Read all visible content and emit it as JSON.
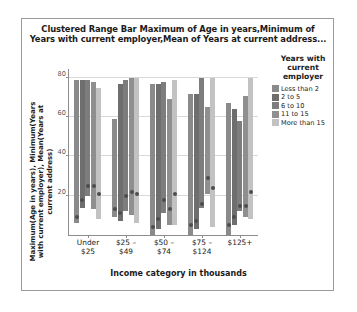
{
  "chart_data": {
    "type": "bar",
    "title": "Clustered Range Bar Maximum of Age in years,Minimum of Years with current employer,Mean of Years at current address...",
    "xlabel": "Income category in thousands",
    "ylabel": "Maximum(Age in years), Minimum(Years with current employer), Mean(Years at current address)",
    "ylim": [
      0,
      85
    ],
    "yticks": [
      20,
      40,
      60,
      80
    ],
    "grid": true,
    "legend_position": "right",
    "legend_title": "Years with current employer",
    "categories": [
      "Under\n$25",
      "$25 –\n$49",
      "$50 –\n$74",
      "$75 –\n$124",
      "$125+"
    ],
    "series": [
      {
        "name": "Less than 2",
        "color": "#8a8a8a",
        "max_age": [
          79,
          59,
          77,
          72,
          67
        ],
        "min_employ": [
          6,
          9,
          0,
          0,
          0
        ],
        "mean_address": [
          9,
          13,
          4,
          5,
          5
        ]
      },
      {
        "name": "2 to 5",
        "color": "#6e6e6e",
        "max_age": [
          79,
          77,
          77,
          72,
          64
        ],
        "min_employ": [
          14,
          7,
          3,
          3,
          5
        ],
        "mean_address": [
          18,
          11,
          8,
          7,
          9
        ]
      },
      {
        "name": "6 to 10",
        "color": "#7d7d7d",
        "max_age": [
          79,
          79,
          78,
          80,
          58
        ],
        "min_employ": [
          20,
          12,
          11,
          14,
          12
        ],
        "mean_address": [
          25,
          20,
          18,
          16,
          15
        ]
      },
      {
        "name": "11 to 15",
        "color": "#8f8f8f",
        "max_age": [
          78,
          80,
          69,
          65,
          71
        ],
        "min_employ": [
          13,
          10,
          5,
          21,
          9
        ],
        "mean_address": [
          25,
          22,
          13,
          29,
          15
        ]
      },
      {
        "name": "More than 15",
        "color": "#c2c2c2",
        "max_age": [
          75,
          80,
          79,
          80,
          80
        ],
        "min_employ": [
          8,
          6,
          5,
          4,
          8
        ],
        "mean_address": [
          21,
          21,
          21,
          24,
          22
        ]
      }
    ]
  }
}
